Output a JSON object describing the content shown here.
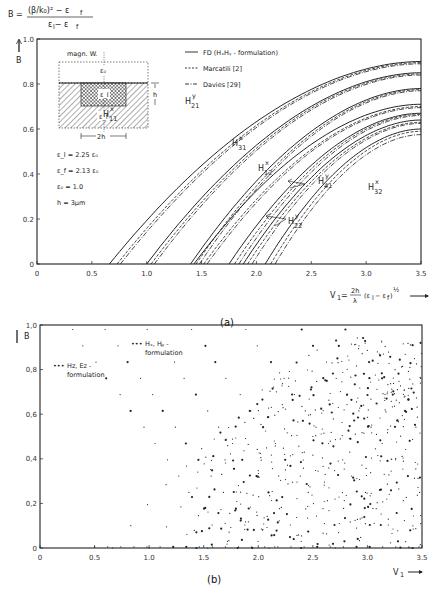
{
  "chart_data": [
    {
      "panel": "(a)",
      "type": "line",
      "formula_label": "B = ((β/k₀)² − ε_f) / (ε_l − ε_f)",
      "ylabel": "B",
      "xlabel": "V₁ = (2h/λ)(ε_l − ε_f)^½",
      "xlim": [
        0,
        3.5
      ],
      "ylim": [
        0,
        1.0
      ],
      "xticks": [
        "0",
        "0.5",
        "1.0",
        "1.5",
        "2.0",
        "2.5",
        "3.0",
        "3.5"
      ],
      "yticks": [
        "0",
        "0.2",
        "0.4",
        "0.6",
        "0.8",
        "1.0"
      ],
      "legend": [
        {
          "style": "solid",
          "label": "FD   (HₓHᵧ - formulation)"
        },
        {
          "style": "dashed",
          "label": "Marcatili [2]"
        },
        {
          "style": "dashdot",
          "label": "Davies [29]"
        }
      ],
      "params": [
        "ε_l = 2.25 ε₀",
        "ε_f = 2.13 ε₀",
        "ε₀ = 1.0",
        "h = 3µm"
      ],
      "inset": {
        "top_label": "magn. W.",
        "cover": "ε₀",
        "core": "ε_l",
        "film": "ε_f",
        "height": "h",
        "width": "2h"
      },
      "mode_labels": [
        {
          "mode": "H",
          "sup": "x",
          "sub": "11"
        },
        {
          "mode": "H",
          "sup": "y",
          "sub": "21"
        },
        {
          "mode": "H",
          "sup": "x",
          "sub": "31"
        },
        {
          "mode": "H",
          "sup": "x",
          "sub": "12"
        },
        {
          "mode": "H",
          "sup": "y",
          "sub": "41"
        },
        {
          "mode": "H",
          "sup": "y",
          "sub": "22"
        },
        {
          "mode": "H",
          "sup": "x",
          "sub": "32"
        }
      ],
      "series": [
        {
          "name": "H11x FD",
          "style": "solid",
          "cutoff": 0.66,
          "end_value": 0.9
        },
        {
          "name": "H11x Marcatili",
          "style": "dashed",
          "cutoff": 0.73,
          "end_value": 0.895
        },
        {
          "name": "H11x Davies",
          "style": "dashdot",
          "cutoff": 0.76,
          "end_value": 0.89
        },
        {
          "name": "H21y FD",
          "style": "solid",
          "cutoff": 1.0,
          "end_value": 0.85
        },
        {
          "name": "H21y Marcatili",
          "style": "dashed",
          "cutoff": 1.04,
          "end_value": 0.845
        },
        {
          "name": "H21y Davies",
          "style": "dashdot",
          "cutoff": 1.07,
          "end_value": 0.84
        },
        {
          "name": "H31x FD",
          "style": "solid",
          "cutoff": 1.4,
          "end_value": 0.78
        },
        {
          "name": "H31x Marcatili",
          "style": "dashed",
          "cutoff": 1.45,
          "end_value": 0.775
        },
        {
          "name": "H31x Davies",
          "style": "dashdot",
          "cutoff": 1.48,
          "end_value": 0.77
        },
        {
          "name": "H12x FD",
          "style": "solid",
          "cutoff": 1.43,
          "end_value": 0.71
        },
        {
          "name": "H12x Marcatili",
          "style": "dashed",
          "cutoff": 1.52,
          "end_value": 0.7
        },
        {
          "name": "H12x Davies",
          "style": "dashdot",
          "cutoff": 1.55,
          "end_value": 0.695
        },
        {
          "name": "H41y FD",
          "style": "solid",
          "cutoff": 1.75,
          "end_value": 0.67
        },
        {
          "name": "H41y Marcatili",
          "style": "dashed",
          "cutoff": 1.8,
          "end_value": 0.665
        },
        {
          "name": "H41y Davies",
          "style": "dashdot",
          "cutoff": 1.84,
          "end_value": 0.66
        },
        {
          "name": "H22y FD",
          "style": "solid",
          "cutoff": 1.88,
          "end_value": 0.64
        },
        {
          "name": "H22y Marcatili",
          "style": "dashed",
          "cutoff": 1.92,
          "end_value": 0.63
        },
        {
          "name": "H22y Davies",
          "style": "dashdot",
          "cutoff": 1.96,
          "end_value": 0.625
        },
        {
          "name": "H32x FD",
          "style": "solid",
          "cutoff": 2.08,
          "end_value": 0.6
        },
        {
          "name": "H32x Marcatili",
          "style": "dashed",
          "cutoff": 2.13,
          "end_value": 0.59
        },
        {
          "name": "H32x Davies",
          "style": "dashdot",
          "cutoff": 2.17,
          "end_value": 0.575
        }
      ]
    },
    {
      "panel": "(b)",
      "type": "scatter",
      "ylabel": "B",
      "xlabel": "V₁",
      "xlim": [
        0,
        3.5
      ],
      "ylim": [
        0,
        1.0
      ],
      "xticks": [
        "0",
        "0.5",
        "1.0",
        "1.5",
        "2.0",
        "2.5",
        "3.0",
        "3.5"
      ],
      "yticks": [
        "0",
        "0,2",
        "0,4",
        "0,6",
        "0,8",
        "1,0"
      ],
      "annotations": [
        {
          "marker": "•••",
          "label": "Hₓ, Hᵧ -",
          "label2": "formulation"
        },
        {
          "marker": "•••",
          "label": "Hz, Ez -",
          "label2": "formulation"
        }
      ],
      "description": "Spurious-mode scatter of computed B vs V₁: falling diagonal bands (Hz,Ez formulation) and rising bands (Hx,Hy formulation), dense above V₁≈1.5"
    }
  ],
  "captions": {
    "a": "(a)",
    "b": "(b)"
  }
}
